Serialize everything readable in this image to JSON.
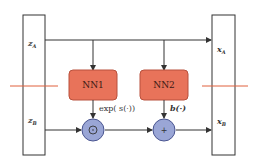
{
  "diagram": {
    "type": "affine coupling layer",
    "inputs": {
      "top": "z_A",
      "bottom": "z_B",
      "top_main": "z",
      "top_sub": "A",
      "bottom_main": "z",
      "bottom_sub": "B"
    },
    "outputs": {
      "top_main": "x",
      "top_sub": "A",
      "bottom_main": "x",
      "bottom_sub": "B"
    },
    "networks": [
      {
        "label": "NN1",
        "output_label": "exp( s(·))"
      },
      {
        "label": "NN2",
        "output_label": "b(·)"
      }
    ],
    "operators": [
      {
        "symbol": "⊙",
        "name": "elementwise-product"
      },
      {
        "symbol": "+",
        "name": "addition"
      }
    ],
    "colors": {
      "nn_fill": "#e8735a",
      "nn_stroke": "#b8513c",
      "op_fill": "#9aa6d6",
      "op_stroke": "#4a5590",
      "split_line": "#e0603c",
      "line": "#333333"
    }
  }
}
